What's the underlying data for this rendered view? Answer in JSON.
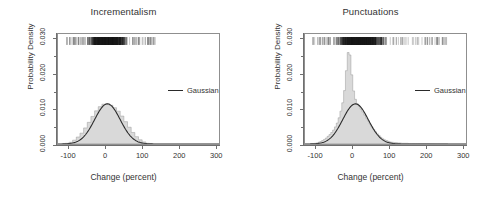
{
  "figure": {
    "xtitle": "Change (percent)",
    "ytitle": "Probability Density"
  },
  "chart_data": [
    {
      "type": "histogram",
      "title": "Incrementalism",
      "xlabel": "Change (percent)",
      "ylabel": "Probability Density",
      "xlim": [
        -130,
        310
      ],
      "ylim": [
        0.0,
        0.0315
      ],
      "xticks": [
        -100,
        0,
        100,
        200,
        300
      ],
      "xtick_labels": [
        "-100",
        "0",
        "100",
        "200",
        "300"
      ],
      "yticks": [
        0.0,
        0.01,
        0.02,
        0.03
      ],
      "ytick_labels": [
        "0.000",
        "0.010",
        "0.020",
        "0.030"
      ],
      "grid": false,
      "legend": {
        "position": "right",
        "entries": [
          "Gaussian"
        ]
      },
      "bin_width": 10,
      "bin_centers": [
        -115,
        -105,
        -95,
        -85,
        -75,
        -65,
        -55,
        -45,
        -35,
        -25,
        -15,
        -5,
        5,
        15,
        25,
        35,
        45,
        55,
        65,
        75,
        85,
        95,
        105,
        115,
        125
      ],
      "bin_density": [
        0.0,
        0.0002,
        0.0005,
        0.0011,
        0.002,
        0.0031,
        0.0046,
        0.0062,
        0.0079,
        0.0095,
        0.0107,
        0.0114,
        0.0115,
        0.0111,
        0.0104,
        0.0094,
        0.008,
        0.0064,
        0.0048,
        0.0033,
        0.0021,
        0.0012,
        0.0006,
        0.0002,
        0.0001
      ],
      "gaussian": {
        "name": "Gaussian",
        "mean": 5,
        "sd": 35,
        "peak_density": 0.0115
      },
      "rug": {
        "present": true,
        "y_position": 0.0295,
        "x_range": [
          -110,
          135
        ],
        "dense_range": [
          -60,
          70
        ]
      }
    },
    {
      "type": "histogram",
      "title": "Punctuations",
      "xlabel": "Change (percent)",
      "ylabel": "Probability Density",
      "xlim": [
        -130,
        310
      ],
      "ylim": [
        0.0,
        0.0315
      ],
      "xticks": [
        -100,
        0,
        100,
        200,
        300
      ],
      "xtick_labels": [
        "-100",
        "0",
        "100",
        "200",
        "300"
      ],
      "yticks": [
        0.0,
        0.01,
        0.02,
        0.03
      ],
      "ytick_labels": [
        "0.000",
        "0.010",
        "0.020",
        "0.030"
      ],
      "grid": false,
      "legend": {
        "position": "right",
        "entries": [
          "Gaussian"
        ]
      },
      "bin_width": 5,
      "bin_centers": [
        -112,
        -107,
        -102,
        -97,
        -92,
        -87,
        -82,
        -77,
        -72,
        -67,
        -62,
        -57,
        -52,
        -47,
        -42,
        -37,
        -32,
        -27,
        -22,
        -17,
        -12,
        -7,
        -2,
        3,
        8,
        13,
        18,
        23,
        28,
        33,
        38,
        43,
        48,
        53,
        58,
        63,
        68,
        73,
        78,
        83,
        88,
        93,
        98,
        103,
        108,
        118,
        128,
        138,
        148,
        158,
        175,
        200,
        230,
        258
      ],
      "bin_density": [
        0.0,
        0.0001,
        0.0002,
        0.0003,
        0.0005,
        0.0007,
        0.001,
        0.0013,
        0.0017,
        0.0022,
        0.0027,
        0.0033,
        0.004,
        0.0049,
        0.006,
        0.0075,
        0.0094,
        0.0118,
        0.0153,
        0.021,
        0.0262,
        0.0255,
        0.0198,
        0.0152,
        0.0128,
        0.0115,
        0.0108,
        0.01,
        0.0092,
        0.0083,
        0.0074,
        0.0066,
        0.0057,
        0.0049,
        0.0042,
        0.0035,
        0.0029,
        0.0024,
        0.0019,
        0.0015,
        0.0012,
        0.001,
        0.0008,
        0.0006,
        0.0005,
        0.0004,
        0.0003,
        0.0002,
        0.0002,
        0.0001,
        0.0001,
        0.0001,
        0.0,
        0.0
      ],
      "gaussian": {
        "name": "Gaussian",
        "mean": 8,
        "sd": 35,
        "peak_density": 0.0115
      },
      "rug": {
        "present": true,
        "y_position": 0.0295,
        "x_range": [
          -110,
          270
        ],
        "dense_range": [
          -60,
          100
        ]
      }
    }
  ]
}
